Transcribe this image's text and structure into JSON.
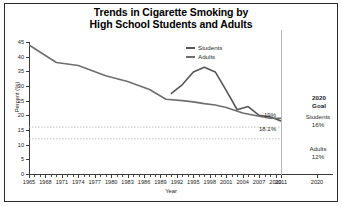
{
  "title": {
    "line1": "Trends in Cigarette Smoking by",
    "line2": "High School Students and Adults"
  },
  "legend": {
    "students": "Students",
    "adults": "Adults"
  },
  "goal": {
    "header_line1": "2020",
    "header_line2": "Goal",
    "students_label": "Students",
    "students_value": "16%",
    "adults_label": "Adults",
    "adults_value": "12%"
  },
  "callouts": {
    "students_end": "19%",
    "adults_end": "18.1%"
  },
  "chart_data": {
    "type": "line",
    "title": "Trends in Cigarette Smoking by High School Students and Adults",
    "xlabel": "Year",
    "ylabel": "Percent (%)",
    "xlim": [
      1965,
      2011
    ],
    "ylim": [
      0,
      45
    ],
    "yticks": [
      0,
      5,
      10,
      15,
      20,
      25,
      30,
      35,
      40,
      45
    ],
    "xticks": [
      1965,
      1968,
      1971,
      1974,
      1977,
      1980,
      1983,
      1986,
      1989,
      1992,
      1995,
      1998,
      2001,
      2004,
      2007,
      2010,
      2011
    ],
    "goal_axis_tick": "2020",
    "grid": false,
    "legend_position": "upper-center-right",
    "series": [
      {
        "name": "Students",
        "color": "#565656",
        "x": [
          1991,
          1993,
          1995,
          1997,
          1999,
          2001,
          2003,
          2005,
          2007,
          2009,
          2011
        ],
        "values": [
          27.5,
          30.5,
          34.8,
          36.4,
          34.8,
          28.5,
          21.9,
          23.0,
          20.0,
          19.5,
          18.1
        ]
      },
      {
        "name": "Adults",
        "color": "#6e6e6e",
        "x": [
          1965,
          1970,
          1974,
          1979,
          1983,
          1987,
          1990,
          1993,
          1995,
          1997,
          1999,
          2001,
          2004,
          2007,
          2009,
          2011
        ],
        "values": [
          44.0,
          38.0,
          37.0,
          33.5,
          31.5,
          28.8,
          25.5,
          25.0,
          24.6,
          24.0,
          23.5,
          22.7,
          20.8,
          19.7,
          19.0,
          19.0
        ]
      }
    ],
    "reference_lines": [
      {
        "label": "Students 2020 Goal",
        "value": 16,
        "style": "dashed"
      },
      {
        "label": "Adults 2020 Goal",
        "value": 12,
        "style": "dashed"
      }
    ],
    "annotations": [
      {
        "text": "19%",
        "value": 19,
        "series": "Students"
      },
      {
        "text": "18.1%",
        "value": 18.1,
        "series": "Adults"
      }
    ]
  }
}
